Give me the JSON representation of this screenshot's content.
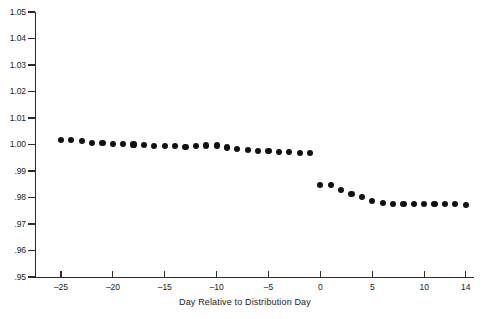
{
  "chart_data": {
    "type": "scatter",
    "title": "",
    "xlabel": "Day Relative to Distribution Day",
    "ylabel": "",
    "xlim": [
      -27.5,
      14.8
    ],
    "ylim": [
      0.95,
      1.05
    ],
    "grid": false,
    "legend": null,
    "marker": "filled-circle",
    "marker_color": "#111111",
    "axis_color": "#2b2b2b",
    "background_color": "#ffffff",
    "x_ticks": [
      -25,
      -20,
      -15,
      -10,
      -5,
      0,
      5,
      10,
      14
    ],
    "x_tick_labels": [
      "–25",
      "–20",
      "–15",
      "–10",
      "–5",
      "0",
      "5",
      "10",
      "14"
    ],
    "y_ticks": [
      0.95,
      0.96,
      0.97,
      0.98,
      0.99,
      1.0,
      1.01,
      1.02,
      1.03,
      1.04,
      1.05
    ],
    "y_tick_labels": [
      ".95",
      ".96",
      ".97",
      ".98",
      ".99",
      "1.00",
      "1.01",
      "1.02",
      "1.03",
      "1.04",
      "1.05"
    ],
    "x": [
      -25,
      -24,
      -23,
      -22,
      -21,
      -20,
      -19,
      -18,
      -17,
      -16,
      -15,
      -14,
      -13,
      -12,
      -11,
      -10,
      -9,
      -8,
      -7,
      -6,
      -5,
      -4,
      -3,
      -2,
      -1,
      0,
      1,
      2,
      3,
      4,
      5,
      6,
      7,
      8,
      9,
      10,
      11,
      12,
      13,
      14
    ],
    "values": [
      1.0018,
      1.0018,
      1.0012,
      1.0007,
      1.0005,
      1.0002,
      1.0002,
      1.0,
      0.9997,
      0.9994,
      0.9993,
      0.9994,
      0.9991,
      0.9993,
      0.9996,
      0.9996,
      0.9989,
      0.9984,
      0.998,
      0.9976,
      0.9974,
      0.9971,
      0.9971,
      0.9969,
      0.9967,
      0.9848,
      0.9848,
      0.9829,
      0.9814,
      0.9801,
      0.9787,
      0.978,
      0.9776,
      0.9775,
      0.9775,
      0.9776,
      0.9774,
      0.9776,
      0.9777,
      0.9773
    ]
  }
}
